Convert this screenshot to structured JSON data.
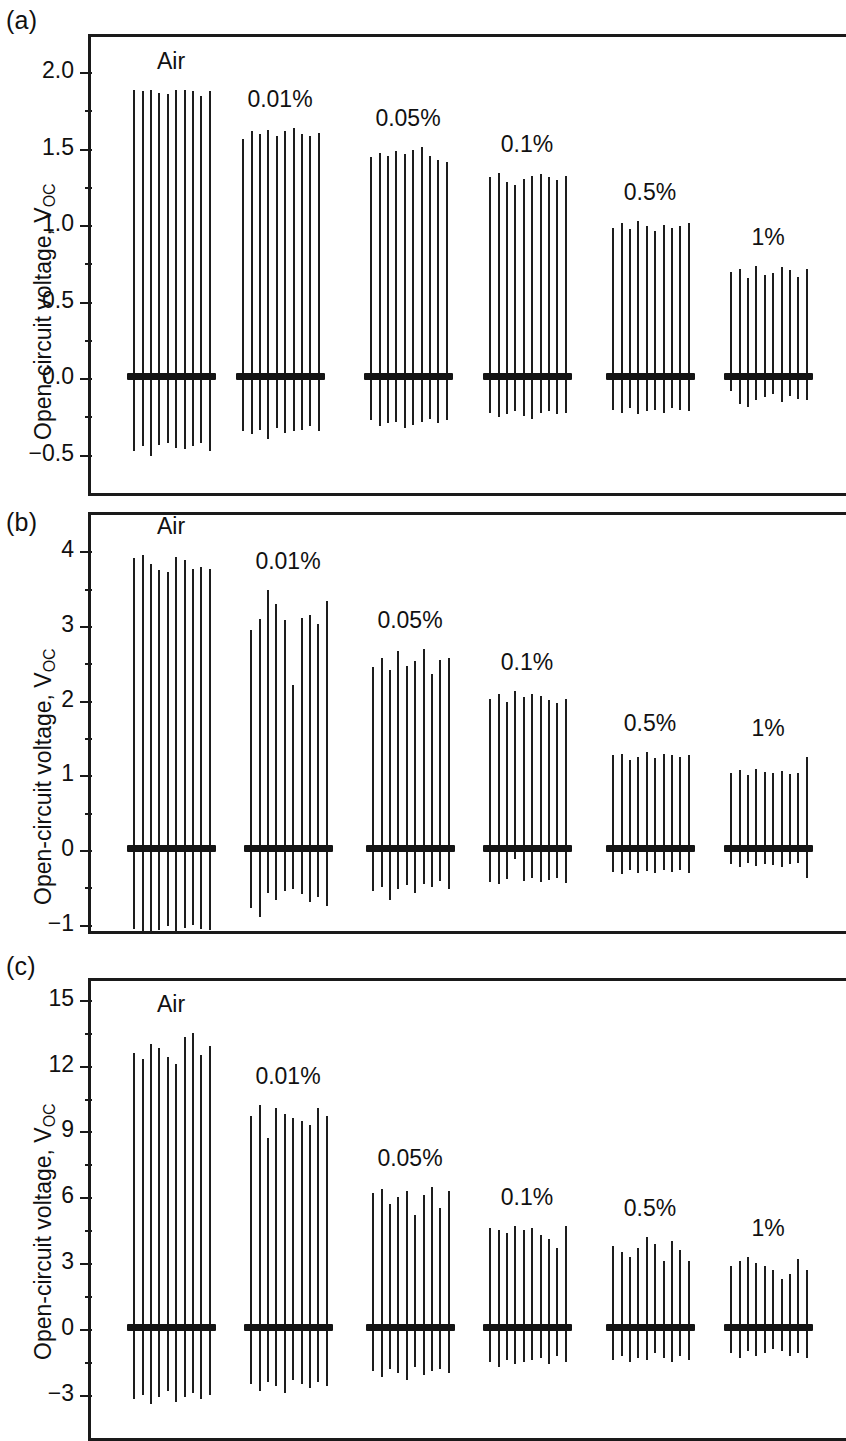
{
  "figure": {
    "axis_label": "Open-circuit voltage, V",
    "axis_label_sub": "OC",
    "line_color": "#1d1d1d",
    "baseline_color": "#141414"
  },
  "panels": [
    {
      "tag": "(a)",
      "ylabel": "Open-circuit voltage, V",
      "ylabel_sub": "OC",
      "ticks": [
        "2.0",
        "1.5",
        "1.0",
        "0.5",
        "0.0",
        "−0.5"
      ],
      "groups": [
        "Air",
        "0.01%",
        "0.05%",
        "0.1%",
        "0.5%",
        "1%"
      ]
    },
    {
      "tag": "(b)",
      "ylabel": "Open-circuit voltage, V",
      "ylabel_sub": "OC",
      "ticks": [
        "4",
        "3",
        "2",
        "1",
        "0",
        "−1"
      ],
      "groups": [
        "Air",
        "0.01%",
        "0.05%",
        "0.1%",
        "0.5%",
        "1%"
      ]
    },
    {
      "tag": "(c)",
      "ylabel": "Open-circuit voltage, V",
      "ylabel_sub": "OC",
      "ticks": [
        "15",
        "12",
        "9",
        "6",
        "3",
        "0",
        "−3"
      ],
      "groups": [
        "Air",
        "0.01%",
        "0.05%",
        "0.1%",
        "0.5%",
        "1%"
      ]
    }
  ],
  "chart_data": [
    {
      "type": "bar",
      "title": "(a)",
      "xlabel": "",
      "ylabel": "Open-circuit voltage, V_OC",
      "ylim": [
        -0.75,
        2.25
      ],
      "yticks": [
        2.0,
        1.5,
        1.0,
        0.5,
        0.0,
        -0.5
      ],
      "grid": false,
      "legend": "none",
      "categories": [
        "Air",
        "0.01%",
        "0.05%",
        "0.1%",
        "0.5%",
        "1%"
      ],
      "series": [
        {
          "name": "Air",
          "positive": [
            1.87,
            1.86,
            1.87,
            1.85,
            1.84,
            1.87,
            1.87,
            1.86,
            1.83,
            1.86
          ],
          "negative": [
            -0.49,
            -0.46,
            -0.52,
            -0.45,
            -0.44,
            -0.47,
            -0.48,
            -0.46,
            -0.44,
            -0.49
          ]
        },
        {
          "name": "0.01%",
          "positive": [
            1.55,
            1.6,
            1.58,
            1.61,
            1.57,
            1.6,
            1.62,
            1.58,
            1.57,
            1.59
          ],
          "negative": [
            -0.36,
            -0.38,
            -0.35,
            -0.41,
            -0.34,
            -0.37,
            -0.36,
            -0.35,
            -0.33,
            -0.36
          ]
        },
        {
          "name": "0.05%",
          "positive": [
            1.43,
            1.46,
            1.44,
            1.47,
            1.45,
            1.48,
            1.5,
            1.44,
            1.41,
            1.4
          ],
          "negative": [
            -0.29,
            -0.33,
            -0.31,
            -0.3,
            -0.34,
            -0.32,
            -0.3,
            -0.28,
            -0.31,
            -0.29
          ]
        },
        {
          "name": "0.1%",
          "positive": [
            1.3,
            1.33,
            1.27,
            1.25,
            1.29,
            1.31,
            1.32,
            1.3,
            1.28,
            1.31
          ],
          "negative": [
            -0.24,
            -0.27,
            -0.25,
            -0.23,
            -0.26,
            -0.28,
            -0.24,
            -0.23,
            -0.25,
            -0.24
          ]
        },
        {
          "name": "0.5%",
          "positive": [
            0.97,
            1.0,
            0.96,
            1.01,
            0.98,
            0.95,
            0.99,
            0.97,
            0.98,
            1.0
          ],
          "negative": [
            -0.22,
            -0.24,
            -0.21,
            -0.25,
            -0.23,
            -0.22,
            -0.24,
            -0.21,
            -0.22,
            -0.23
          ]
        },
        {
          "name": "1%",
          "positive": [
            0.68,
            0.7,
            0.64,
            0.72,
            0.66,
            0.67,
            0.71,
            0.69,
            0.65,
            0.7
          ],
          "negative": [
            -0.1,
            -0.18,
            -0.2,
            -0.16,
            -0.14,
            -0.12,
            -0.17,
            -0.13,
            -0.15,
            -0.16
          ]
        }
      ]
    },
    {
      "type": "bar",
      "title": "(b)",
      "xlabel": "",
      "ylabel": "Open-circuit voltage, V_OC",
      "ylim": [
        -1.5,
        4.5
      ],
      "yticks": [
        4,
        3,
        2,
        1,
        0,
        -1
      ],
      "grid": false,
      "legend": "none",
      "categories": [
        "Air",
        "0.01%",
        "0.05%",
        "0.1%",
        "0.5%",
        "1%"
      ],
      "series": [
        {
          "name": "Air",
          "positive": [
            3.88,
            3.92,
            3.8,
            3.72,
            3.7,
            3.9,
            3.85,
            3.74,
            3.76,
            3.73
          ],
          "negative": [
            -1.08,
            -1.16,
            -1.25,
            -1.1,
            -1.05,
            -1.12,
            -1.07,
            -1.03,
            -1.09,
            -1.1
          ]
        },
        {
          "name": "0.01%",
          "positive": [
            2.92,
            3.06,
            3.46,
            3.26,
            3.05,
            2.18,
            3.08,
            3.12,
            3.0,
            3.3
          ],
          "negative": [
            -0.8,
            -0.92,
            -0.6,
            -0.7,
            -0.58,
            -0.55,
            -0.62,
            -0.72,
            -0.66,
            -0.78
          ]
        },
        {
          "name": "0.05%",
          "positive": [
            2.42,
            2.55,
            2.38,
            2.64,
            2.44,
            2.5,
            2.66,
            2.33,
            2.52,
            2.55
          ],
          "negative": [
            -0.58,
            -0.52,
            -0.7,
            -0.55,
            -0.5,
            -0.6,
            -0.48,
            -0.52,
            -0.44,
            -0.55
          ]
        },
        {
          "name": "0.1%",
          "positive": [
            2.0,
            2.06,
            1.96,
            2.1,
            2.02,
            2.06,
            2.04,
            1.98,
            1.94,
            2.0
          ],
          "negative": [
            -0.45,
            -0.48,
            -0.42,
            -0.15,
            -0.44,
            -0.4,
            -0.46,
            -0.43,
            -0.4,
            -0.47
          ]
        },
        {
          "name": "0.5%",
          "positive": [
            1.24,
            1.26,
            1.18,
            1.22,
            1.28,
            1.2,
            1.26,
            1.24,
            1.22,
            1.25
          ],
          "negative": [
            -0.32,
            -0.35,
            -0.3,
            -0.34,
            -0.31,
            -0.33,
            -0.29,
            -0.32,
            -0.3,
            -0.34
          ]
        },
        {
          "name": "1%",
          "positive": [
            1.0,
            1.04,
            0.98,
            1.06,
            1.02,
            1.0,
            1.03,
            0.99,
            1.01,
            1.22
          ],
          "negative": [
            -0.22,
            -0.26,
            -0.2,
            -0.24,
            -0.21,
            -0.23,
            -0.25,
            -0.22,
            -0.2,
            -0.4
          ]
        }
      ]
    },
    {
      "type": "bar",
      "title": "(c)",
      "xlabel": "",
      "ylabel": "Open-circuit voltage, V_OC",
      "ylim": [
        -4.5,
        16.5
      ],
      "yticks": [
        15,
        12,
        9,
        6,
        3,
        0,
        -3
      ],
      "grid": false,
      "legend": "none",
      "categories": [
        "Air",
        "0.01%",
        "0.05%",
        "0.1%",
        "0.5%",
        "1%"
      ],
      "series": [
        {
          "name": "Air",
          "positive": [
            12.5,
            12.2,
            12.9,
            12.7,
            12.3,
            12.0,
            13.2,
            13.4,
            12.4,
            12.8
          ],
          "negative": [
            -3.3,
            -3.1,
            -3.5,
            -3.2,
            -2.9,
            -3.4,
            -3.2,
            -3.0,
            -3.3,
            -3.1
          ]
        },
        {
          "name": "0.01%",
          "positive": [
            9.6,
            10.1,
            8.6,
            10.0,
            9.7,
            9.5,
            9.4,
            9.2,
            10.0,
            9.6
          ],
          "negative": [
            -2.6,
            -2.9,
            -2.5,
            -2.7,
            -3.0,
            -2.4,
            -2.6,
            -2.8,
            -2.5,
            -2.7
          ]
        },
        {
          "name": "0.05%",
          "positive": [
            6.1,
            6.3,
            5.6,
            5.9,
            6.2,
            5.1,
            6.0,
            6.4,
            5.4,
            6.2
          ],
          "negative": [
            -2.0,
            -2.3,
            -1.9,
            -2.1,
            -2.4,
            -1.8,
            -2.2,
            -2.0,
            -1.9,
            -2.1
          ]
        },
        {
          "name": "0.1%",
          "positive": [
            4.5,
            4.4,
            4.3,
            4.6,
            4.4,
            4.5,
            4.2,
            4.0,
            3.6,
            4.6
          ],
          "negative": [
            -1.6,
            -1.8,
            -1.5,
            -1.7,
            -1.6,
            -1.5,
            -1.4,
            -1.7,
            -1.3,
            -1.6
          ]
        },
        {
          "name": "0.5%",
          "positive": [
            3.7,
            3.4,
            3.2,
            3.6,
            4.1,
            3.8,
            3.0,
            3.9,
            3.5,
            3.0
          ],
          "negative": [
            -1.5,
            -1.3,
            -1.6,
            -1.4,
            -1.5,
            -1.2,
            -1.4,
            -1.6,
            -1.3,
            -1.5
          ]
        },
        {
          "name": "1%",
          "positive": [
            2.8,
            3.0,
            3.2,
            2.9,
            2.8,
            2.6,
            2.2,
            2.4,
            3.1,
            2.6
          ],
          "negative": [
            -1.2,
            -1.4,
            -1.1,
            -1.3,
            -1.2,
            -1.0,
            -1.1,
            -1.3,
            -1.2,
            -1.4
          ]
        }
      ]
    }
  ]
}
